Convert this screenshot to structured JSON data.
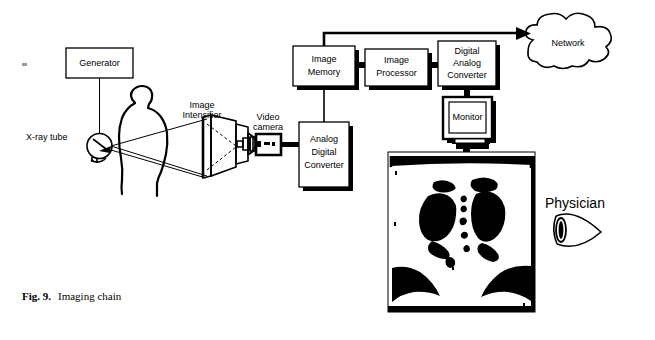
{
  "figure": {
    "caption_prefix": "Fig. 9.",
    "caption_text": "Imaging chain",
    "background_color": "#ffffff",
    "ink_color": "#000000"
  },
  "diagram": {
    "type": "block-diagram",
    "title": "Imaging chain",
    "nodes": [
      {
        "id": "generator",
        "label": "Generator",
        "shape": "box",
        "x": 66,
        "y": 48,
        "w": 67,
        "h": 30
      },
      {
        "id": "xray-tube",
        "label": "X-ray tube",
        "shape": "circle",
        "x": 83,
        "y": 138,
        "r": 12
      },
      {
        "id": "patient",
        "label": "",
        "shape": "silhouette"
      },
      {
        "id": "intensifier",
        "label_line1": "Image",
        "label_line2": "Intensifier",
        "shape": "cone"
      },
      {
        "id": "video-cam",
        "label_line1": "Video",
        "label_line2": "camera",
        "shape": "camera"
      },
      {
        "id": "adc",
        "label_line1": "Analog",
        "label_line2": "Digital",
        "label_line3": "Converter",
        "shape": "box-shadow",
        "x": 299,
        "y": 122,
        "w": 50,
        "h": 65
      },
      {
        "id": "image-mem",
        "label_line1": "Image",
        "label_line2": "Memory",
        "shape": "box-shadow",
        "x": 293,
        "y": 46,
        "w": 62,
        "h": 40
      },
      {
        "id": "image-proc",
        "label_line1": "Image",
        "label_line2": "Processor",
        "shape": "box-shadow",
        "x": 365,
        "y": 49,
        "w": 63,
        "h": 37
      },
      {
        "id": "dac",
        "label_line1": "Digital",
        "label_line2": "Analog",
        "label_line3": "Converter",
        "shape": "box-shadow",
        "x": 438,
        "y": 41,
        "w": 58,
        "h": 45
      },
      {
        "id": "monitor",
        "label": "Monitor",
        "shape": "crt",
        "x": 443,
        "y": 97,
        "w": 49,
        "h": 42
      },
      {
        "id": "network",
        "label": "Network",
        "shape": "cloud",
        "x": 515,
        "y": 22,
        "w": 130,
        "h": 55
      },
      {
        "id": "xray-film",
        "label": "",
        "shape": "radiograph",
        "x": 388,
        "y": 152,
        "w": 147,
        "h": 160
      },
      {
        "id": "physician",
        "label": "Physician",
        "shape": "eye",
        "x": 548,
        "y": 196
      }
    ],
    "labels": {
      "generator": "Generator",
      "xray_tube": "X-ray tube",
      "image_intensifier_line1": "Image",
      "image_intensifier_line2": "Intensifier",
      "video_camera_line1": "Video",
      "video_camera_line2": "camera",
      "adc_line1": "Analog",
      "adc_line2": "Digital",
      "adc_line3": "Converter",
      "image_memory_line1": "Image",
      "image_memory_line2": "Memory",
      "image_processor_line1": "Image",
      "image_processor_line2": "Processor",
      "dac_line1": "Digital",
      "dac_line2": "Analog",
      "dac_line3": "Converter",
      "monitor": "Monitor",
      "network": "Network",
      "physician": "Physician"
    },
    "connections": [
      {
        "from": "generator",
        "to": "xray-tube",
        "kind": "line"
      },
      {
        "from": "xray-tube",
        "to": "intensifier",
        "kind": "beam-cone"
      },
      {
        "from": "intensifier",
        "to": "video-cam",
        "kind": "optical"
      },
      {
        "from": "video-cam",
        "to": "adc",
        "kind": "thick-line"
      },
      {
        "from": "adc",
        "to": "image-mem",
        "kind": "line"
      },
      {
        "from": "image-mem",
        "to": "image-proc",
        "kind": "thick-line"
      },
      {
        "from": "image-proc",
        "to": "dac",
        "kind": "thick-line"
      },
      {
        "from": "dac",
        "to": "monitor",
        "kind": "thick-line"
      },
      {
        "from": "image-mem",
        "to": "network",
        "kind": "arrow"
      },
      {
        "from": "monitor",
        "to": "xray-film",
        "kind": "thick-line"
      },
      {
        "from": "xray-film",
        "to": "physician",
        "kind": "view"
      }
    ]
  }
}
